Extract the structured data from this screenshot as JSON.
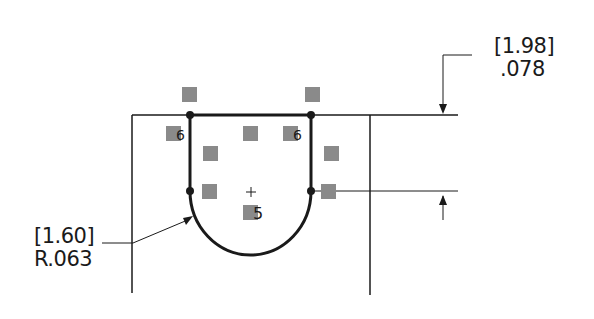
{
  "drawing": {
    "dimension_top": {
      "bracket_value": "[1.98]",
      "value": ".078"
    },
    "dimension_radius": {
      "bracket_value": "[1.60]",
      "value": "R.063"
    },
    "center_mark": "+",
    "constraint_badge_label": "5",
    "coincident_badge_label": "6",
    "colors": {
      "line": "#1a1a1a",
      "badge": "#8a8a8a"
    }
  }
}
